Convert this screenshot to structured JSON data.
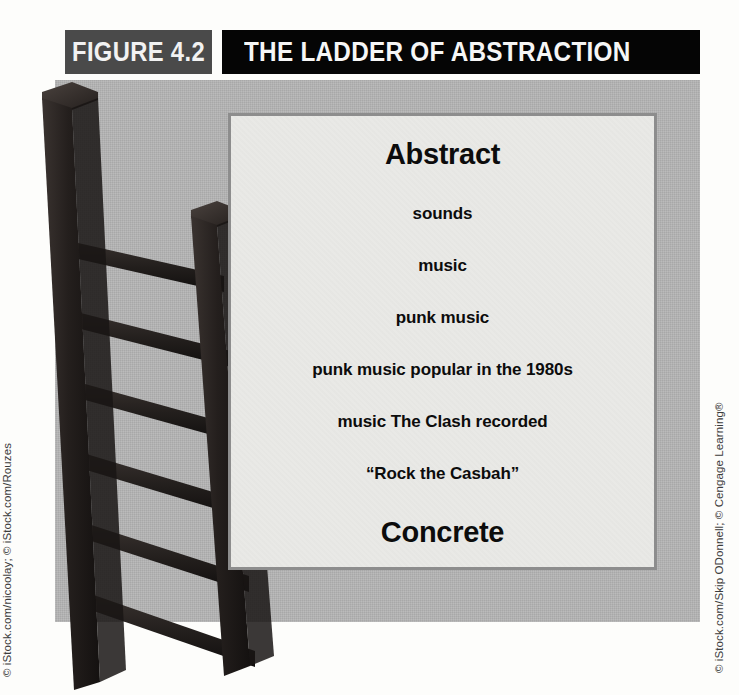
{
  "figure": {
    "number_label": "FIGURE 4.2",
    "title": "THE LADDER OF ABSTRACTION"
  },
  "ladder_steps": [
    {
      "text": "Abstract",
      "emphasis": "cap"
    },
    {
      "text": "sounds",
      "emphasis": "step"
    },
    {
      "text": "music",
      "emphasis": "step"
    },
    {
      "text": "punk music",
      "emphasis": "step"
    },
    {
      "text": "punk music popular in the 1980s",
      "emphasis": "step"
    },
    {
      "text": "music The Clash recorded",
      "emphasis": "step"
    },
    {
      "text": "“Rock the Casbah”",
      "emphasis": "step"
    },
    {
      "text": "Concrete",
      "emphasis": "cap"
    }
  ],
  "credits": {
    "left": "© iStock.com/nicoolay; © iStock.com/Rouzes",
    "right": "© iStock.com/Skip ODonnell; © Cengage Learning®"
  },
  "illustration": {
    "name": "wooden-ladder-photo",
    "alt": "Photograph of a dark wooden ladder leaning, seen from below"
  },
  "colors": {
    "page_background": "#fdfdfb",
    "header_number_bg": "#4a4a4a",
    "header_title_bg": "#050505",
    "header_text": "#f6f6f6",
    "panel_bg": "#b3b3b3",
    "inner_box_bg": "#e9e9e6",
    "inner_box_border": "#8d8d8d",
    "body_text": "#0c0c0c",
    "ladder_dark": "#231f1d",
    "credit_text": "#3c3c3c"
  }
}
